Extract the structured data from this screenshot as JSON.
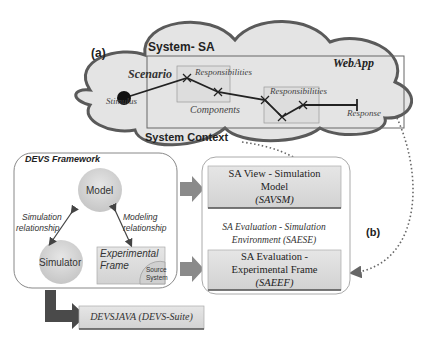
{
  "diagram": {
    "part_a": {
      "label": "(a)",
      "cloud_title": "System- SA",
      "webapp_label": "WebApp",
      "scenario_label": "Scenario",
      "stimulus_label": "Stimulus",
      "responsibilities_1": "Responsibilities",
      "responsibilities_2": "Responsibilities",
      "components_label": "Components",
      "response_label": "Response",
      "context_label": "System Context"
    },
    "devs_framework": {
      "title": "DEVS Framework",
      "model": "Model",
      "simulator": "Simulator",
      "simulation_relationship_1": "Simulation",
      "simulation_relationship_2": "relationship",
      "modeling_relationship_1": "Modeling",
      "modeling_relationship_2": "relationship",
      "experimental_frame_1": "Experimental",
      "experimental_frame_2": "Frame",
      "source_system_1": "Source",
      "source_system_2": "System"
    },
    "part_b": {
      "label": "(b)",
      "savsm_line1": "SA View - Simulation",
      "savsm_line2": "Model",
      "savsm_line3": "(SAVSM)",
      "saese_line1": "SA Evaluation - Simulation",
      "saese_line2": "Environment (SAESE)",
      "saeef_line1": "SA Evaluation -",
      "saeef_line2": "Experimental Frame",
      "saeef_line3": "(SAEEF)"
    },
    "devsjava": "DEVSJAVA (DEVS-Suite)",
    "colors": {
      "cloud_fill": "#e4e4e4",
      "cloud_stroke": "#5a5a5a",
      "box_fill": "#dcdcdc",
      "arrow_fill": "#8a8a8a",
      "dark_arrow": "#4a4a4a"
    }
  }
}
